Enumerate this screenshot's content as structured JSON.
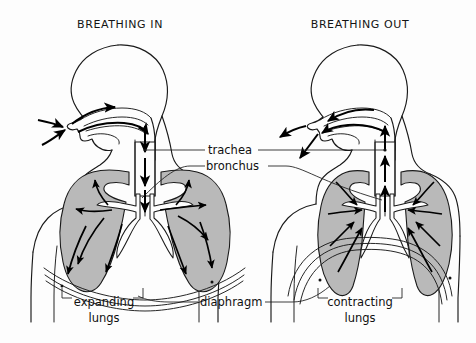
{
  "figure": {
    "background_color": "#fdfdfd",
    "ink_color": "#1a1a1a",
    "lung_fill_color": "#b9b9b9"
  },
  "panels": [
    {
      "id": "breathing-in",
      "title": "BREATHING IN",
      "title_x": 120,
      "title_y": 28
    },
    {
      "id": "breathing-out",
      "title": "BREATHING OUT",
      "title_x": 360,
      "title_y": 28
    }
  ],
  "labels": {
    "trachea": "trachea",
    "bronchus": "bronchus",
    "diaphragm": "diaphragm",
    "expanding_lungs_line1": "expanding",
    "expanding_lungs_line2": "lungs",
    "contracting_lungs_line1": "contracting",
    "contracting_lungs_line2": "lungs"
  },
  "diagram_data": {
    "type": "anatomical-diagram",
    "subject": "human respiratory system",
    "comparison": [
      "inhalation",
      "exhalation"
    ],
    "labeled_parts": [
      "trachea",
      "bronchus",
      "diaphragm",
      "expanding lungs",
      "contracting lungs"
    ],
    "left_panel": {
      "state": "inhalation",
      "air_direction": "inward",
      "nose_arrows": "air enters through nostrils and mouth",
      "trachea_arrows": "downward",
      "lung_arrows": "radiating outward",
      "diaphragm_shape": "flattened / lowered",
      "lung_state": "expanding"
    },
    "right_panel": {
      "state": "exhalation",
      "air_direction": "outward",
      "nose_arrows": "air exits through nostrils and mouth",
      "trachea_arrows": "upward",
      "lung_arrows": "converging inward",
      "diaphragm_shape": "domed / raised",
      "lung_state": "contracting"
    }
  }
}
